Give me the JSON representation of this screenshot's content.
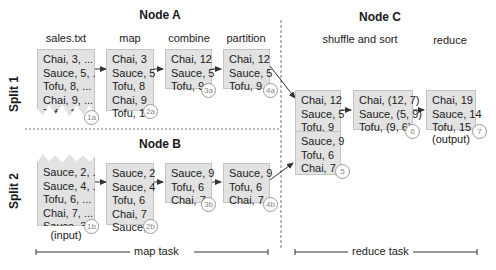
{
  "nodes": {
    "a": "Node A",
    "b": "Node B",
    "c": "Node C"
  },
  "splits": {
    "split1": "Split 1",
    "split2": "Split 2"
  },
  "stages": {
    "input_file": "sales.txt",
    "map": "map",
    "combine": "combine",
    "partition": "partition",
    "shuffle": "shuffle and sort",
    "reduce": "reduce"
  },
  "boxes": {
    "b1a": {
      "lines": [
        "Chai, 3, ...",
        "Sauce, 5, ...",
        "Tofu, 8, ...",
        "Chai, 9, ...",
        "Tofu, 1, ..."
      ],
      "badge": "1a"
    },
    "b2a": {
      "lines": [
        "Chai, 3",
        "Sauce, 5",
        "Tofu, 8",
        "Chai, 9",
        "Tofu, 1"
      ],
      "badge": "2a"
    },
    "b3a": {
      "lines": [
        "Chai, 12",
        "Sauce, 5",
        "Tofu, 9"
      ],
      "badge": "3a"
    },
    "b4a": {
      "lines": [
        "Chai, 12",
        "Sauce, 5",
        "Tofu, 9"
      ],
      "badge": "4a"
    },
    "b1b": {
      "lines": [
        "Sauce, 2, ...",
        "Sauce, 4, ...",
        "Tofu, 6, ...",
        "Chai, 7, ...",
        "Sauce, 3, ..."
      ],
      "badge": "1b"
    },
    "b2b": {
      "lines": [
        "Sauce, 2",
        "Sauce, 4",
        "Tofu, 6",
        "Chai, 7",
        "Sauce, 3"
      ],
      "badge": "2b"
    },
    "b3b": {
      "lines": [
        "Sauce, 9",
        "Tofu, 6",
        "Chai, 7"
      ],
      "badge": "3b"
    },
    "b4b": {
      "lines": [
        "Sauce, 9",
        "Tofu, 6",
        "Chai, 7"
      ],
      "badge": "4b"
    },
    "b5": {
      "lines_top": [
        "Chai, 12",
        "Sauce, 5",
        "Tofu, 9"
      ],
      "lines_bottom": [
        "Sauce, 9",
        "Tofu, 6",
        "Chai, 7"
      ],
      "badge": "5"
    },
    "b6": {
      "lines": [
        "Chai, (12, 7)",
        "Sauce, (5, 9)",
        "Tofu, (9, 6)"
      ],
      "badge": "6"
    },
    "b7": {
      "lines": [
        "Chai, 19",
        "Sauce, 14",
        "Tofu, 15"
      ],
      "badge": "7"
    }
  },
  "captions": {
    "input": "(input)",
    "output": "(output)"
  },
  "tasks": {
    "map": "map task",
    "reduce": "reduce task"
  },
  "colors": {
    "box_fill": "#e2e2e2",
    "box_border": "#c4c4c4",
    "arrow": "#333333",
    "divider": "#777777"
  }
}
